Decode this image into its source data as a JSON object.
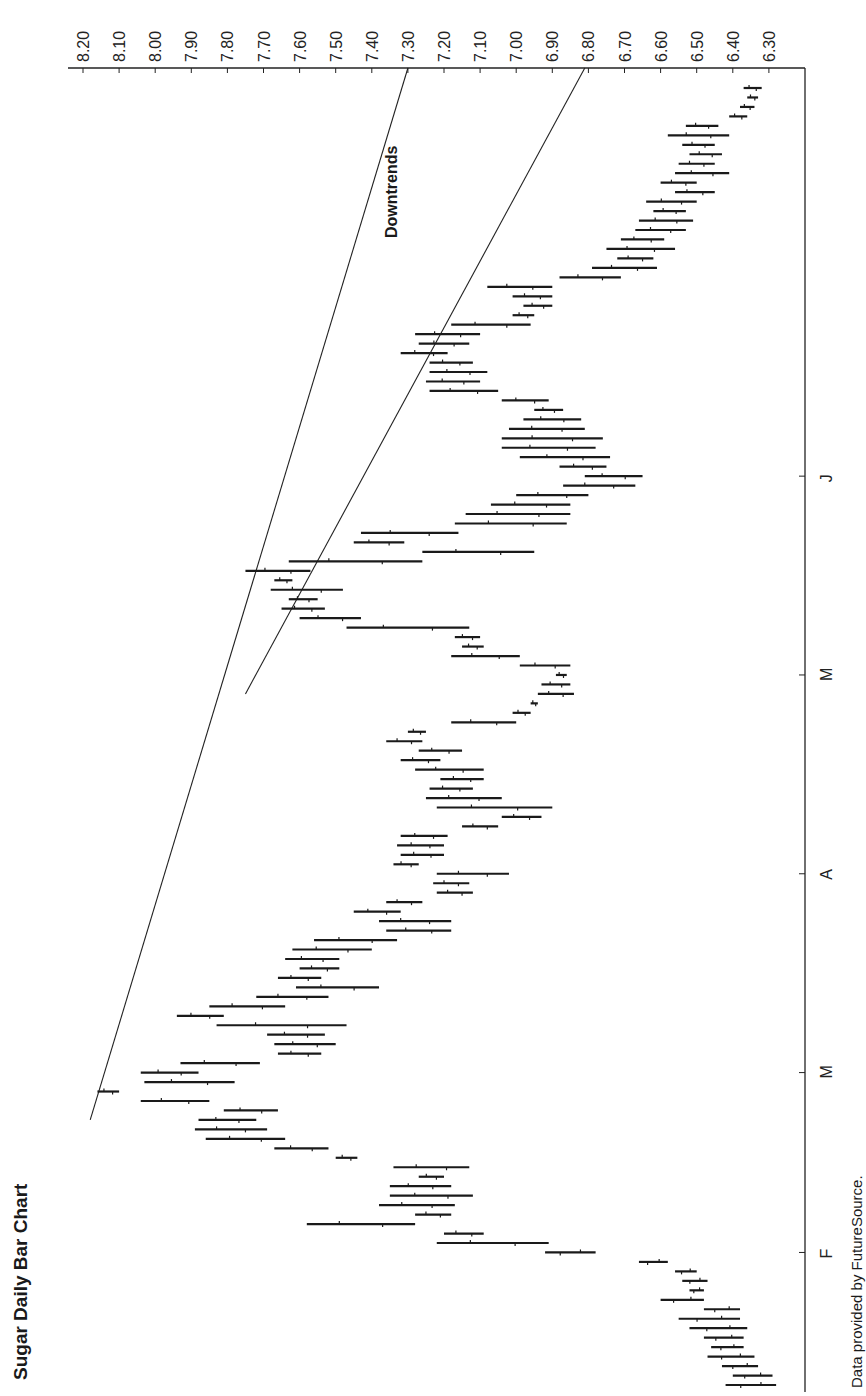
{
  "title": "Sugar Daily Bar Chart",
  "source": "Data provided by FutureSource.",
  "annotation": "Downtrends",
  "chart_data": {
    "type": "bar",
    "subtype": "ohlc-daily",
    "orientation": "rotated-90-ccw",
    "title": "Sugar Daily Bar Chart",
    "xlabel": "",
    "ylabel": "",
    "price_ticks": [
      "8.20",
      "8.10",
      "8.00",
      "7.90",
      "7.80",
      "7.70",
      "7.60",
      "7.50",
      "7.40",
      "7.30",
      "7.20",
      "7.10",
      "7.00",
      "6.90",
      "6.80",
      "6.70",
      "6.60",
      "6.50",
      "6.40",
      "6.30"
    ],
    "price_range": [
      6.25,
      8.22
    ],
    "month_ticks": [
      {
        "label": "F",
        "day": 14
      },
      {
        "label": "M",
        "day": 33
      },
      {
        "label": "A",
        "day": 54
      },
      {
        "label": "M",
        "day": 75
      },
      {
        "label": "J",
        "day": 96
      }
    ],
    "annotations": [
      "Downtrends"
    ],
    "trendlines": [
      {
        "name": "downtrend-1",
        "from": {
          "day": 28,
          "price": 8.18
        },
        "to": {
          "day": 117,
          "price": 7.3
        }
      },
      {
        "name": "downtrend-2",
        "from": {
          "day": 73,
          "price": 7.75
        },
        "to": {
          "day": 117,
          "price": 6.81
        }
      }
    ],
    "bars": [
      {
        "day": 0,
        "high": 6.28,
        "low": 6.42
      },
      {
        "day": 1,
        "high": 6.29,
        "low": 6.4
      },
      {
        "day": 2,
        "high": 6.33,
        "low": 6.43
      },
      {
        "day": 3,
        "high": 6.34,
        "low": 6.47
      },
      {
        "day": 4,
        "high": 6.37,
        "low": 6.46
      },
      {
        "day": 5,
        "high": 6.37,
        "low": 6.48
      },
      {
        "day": 6,
        "high": 6.36,
        "low": 6.52
      },
      {
        "day": 7,
        "high": 6.38,
        "low": 6.55
      },
      {
        "day": 8,
        "high": 6.38,
        "low": 6.48
      },
      {
        "day": 9,
        "high": 6.48,
        "low": 6.6
      },
      {
        "day": 10,
        "high": 6.48,
        "low": 6.52
      },
      {
        "day": 11,
        "high": 6.47,
        "low": 6.54
      },
      {
        "day": 12,
        "high": 6.5,
        "low": 6.56
      },
      {
        "day": 13,
        "high": 6.58,
        "low": 6.66
      },
      {
        "day": 14,
        "high": 6.78,
        "low": 6.92
      },
      {
        "day": 15,
        "high": 7.22,
        "low": 6.91
      },
      {
        "day": 16,
        "high": 7.2,
        "low": 7.09
      },
      {
        "day": 17,
        "high": 7.58,
        "low": 7.28
      },
      {
        "day": 18,
        "high": 7.28,
        "low": 7.18
      },
      {
        "day": 19,
        "high": 7.38,
        "low": 7.17
      },
      {
        "day": 20,
        "high": 7.35,
        "low": 7.12
      },
      {
        "day": 21,
        "high": 7.35,
        "low": 7.18
      },
      {
        "day": 22,
        "high": 7.27,
        "low": 7.2
      },
      {
        "day": 23,
        "high": 7.34,
        "low": 7.13
      },
      {
        "day": 24,
        "high": 7.5,
        "low": 7.44
      },
      {
        "day": 25,
        "high": 7.67,
        "low": 7.52
      },
      {
        "day": 26,
        "high": 7.86,
        "low": 7.64
      },
      {
        "day": 27,
        "high": 7.89,
        "low": 7.69
      },
      {
        "day": 28,
        "high": 7.88,
        "low": 7.72
      },
      {
        "day": 29,
        "high": 7.81,
        "low": 7.66
      },
      {
        "day": 30,
        "high": 8.04,
        "low": 7.85
      },
      {
        "day": 31,
        "high": 8.16,
        "low": 8.1
      },
      {
        "day": 32,
        "high": 8.03,
        "low": 7.78
      },
      {
        "day": 33,
        "high": 8.04,
        "low": 7.88
      },
      {
        "day": 34,
        "high": 7.93,
        "low": 7.71
      },
      {
        "day": 35,
        "high": 7.66,
        "low": 7.54
      },
      {
        "day": 36,
        "high": 7.67,
        "low": 7.5
      },
      {
        "day": 37,
        "high": 7.69,
        "low": 7.53
      },
      {
        "day": 38,
        "high": 7.83,
        "low": 7.47
      },
      {
        "day": 39,
        "high": 7.94,
        "low": 7.81
      },
      {
        "day": 40,
        "high": 7.85,
        "low": 7.64
      },
      {
        "day": 41,
        "high": 7.72,
        "low": 7.52
      },
      {
        "day": 42,
        "high": 7.61,
        "low": 7.38
      },
      {
        "day": 43,
        "high": 7.66,
        "low": 7.54
      },
      {
        "day": 44,
        "high": 7.6,
        "low": 7.49
      },
      {
        "day": 45,
        "high": 7.64,
        "low": 7.49
      },
      {
        "day": 46,
        "high": 7.62,
        "low": 7.4
      },
      {
        "day": 47,
        "high": 7.56,
        "low": 7.33
      },
      {
        "day": 48,
        "high": 7.36,
        "low": 7.18
      },
      {
        "day": 49,
        "high": 7.38,
        "low": 7.18
      },
      {
        "day": 50,
        "high": 7.45,
        "low": 7.32
      },
      {
        "day": 51,
        "high": 7.36,
        "low": 7.26
      },
      {
        "day": 52,
        "high": 7.22,
        "low": 7.12
      },
      {
        "day": 53,
        "high": 7.23,
        "low": 7.13
      },
      {
        "day": 54,
        "high": 7.22,
        "low": 7.02
      },
      {
        "day": 55,
        "high": 7.34,
        "low": 7.27
      },
      {
        "day": 56,
        "high": 7.32,
        "low": 7.2
      },
      {
        "day": 57,
        "high": 7.33,
        "low": 7.2
      },
      {
        "day": 58,
        "high": 7.32,
        "low": 7.19
      },
      {
        "day": 59,
        "high": 7.15,
        "low": 7.05
      },
      {
        "day": 60,
        "high": 7.04,
        "low": 6.93
      },
      {
        "day": 61,
        "high": 7.22,
        "low": 6.9
      },
      {
        "day": 62,
        "high": 7.25,
        "low": 7.04
      },
      {
        "day": 63,
        "high": 7.24,
        "low": 7.12
      },
      {
        "day": 64,
        "high": 7.21,
        "low": 7.09
      },
      {
        "day": 65,
        "high": 7.28,
        "low": 7.09
      },
      {
        "day": 66,
        "high": 7.32,
        "low": 7.21
      },
      {
        "day": 67,
        "high": 7.27,
        "low": 7.15
      },
      {
        "day": 68,
        "high": 7.36,
        "low": 7.26
      },
      {
        "day": 69,
        "high": 7.3,
        "low": 7.25
      },
      {
        "day": 70,
        "high": 7.18,
        "low": 7.0
      },
      {
        "day": 71,
        "high": 7.01,
        "low": 6.96
      },
      {
        "day": 72,
        "high": 6.96,
        "low": 6.94
      },
      {
        "day": 73,
        "high": 6.94,
        "low": 6.84
      },
      {
        "day": 74,
        "high": 6.93,
        "low": 6.85
      },
      {
        "day": 75,
        "high": 6.89,
        "low": 6.86
      },
      {
        "day": 76,
        "high": 6.99,
        "low": 6.85
      },
      {
        "day": 77,
        "high": 7.18,
        "low": 6.99
      },
      {
        "day": 78,
        "high": 7.15,
        "low": 7.09
      },
      {
        "day": 79,
        "high": 7.17,
        "low": 7.1
      },
      {
        "day": 80,
        "high": 7.47,
        "low": 7.13
      },
      {
        "day": 81,
        "high": 7.6,
        "low": 7.43
      },
      {
        "day": 82,
        "high": 7.65,
        "low": 7.53
      },
      {
        "day": 83,
        "high": 7.63,
        "low": 7.55
      },
      {
        "day": 84,
        "high": 7.68,
        "low": 7.48
      },
      {
        "day": 85,
        "high": 7.67,
        "low": 7.62
      },
      {
        "day": 86,
        "high": 7.75,
        "low": 7.57
      },
      {
        "day": 87,
        "high": 7.63,
        "low": 7.26
      },
      {
        "day": 88,
        "high": 7.26,
        "low": 6.95
      },
      {
        "day": 89,
        "high": 7.45,
        "low": 7.31
      },
      {
        "day": 90,
        "high": 7.43,
        "low": 7.16
      },
      {
        "day": 91,
        "high": 7.17,
        "low": 6.86
      },
      {
        "day": 92,
        "high": 7.14,
        "low": 6.85
      },
      {
        "day": 93,
        "high": 7.07,
        "low": 6.85
      },
      {
        "day": 94,
        "high": 7.0,
        "low": 6.8
      },
      {
        "day": 95,
        "high": 6.87,
        "low": 6.67
      },
      {
        "day": 96,
        "high": 6.81,
        "low": 6.65
      },
      {
        "day": 97,
        "high": 6.88,
        "low": 6.75
      },
      {
        "day": 98,
        "high": 6.99,
        "low": 6.74
      },
      {
        "day": 99,
        "high": 7.04,
        "low": 6.78
      },
      {
        "day": 100,
        "high": 7.04,
        "low": 6.76
      },
      {
        "day": 101,
        "high": 7.02,
        "low": 6.81
      },
      {
        "day": 102,
        "high": 6.98,
        "low": 6.82
      },
      {
        "day": 103,
        "high": 6.95,
        "low": 6.87
      },
      {
        "day": 104,
        "high": 7.04,
        "low": 6.91
      },
      {
        "day": 105,
        "high": 7.24,
        "low": 7.05
      },
      {
        "day": 106,
        "high": 7.25,
        "low": 7.1
      },
      {
        "day": 107,
        "high": 7.24,
        "low": 7.08
      },
      {
        "day": 108,
        "high": 7.24,
        "low": 7.12
      },
      {
        "day": 109,
        "high": 7.32,
        "low": 7.19
      },
      {
        "day": 110,
        "high": 7.27,
        "low": 7.13
      },
      {
        "day": 111,
        "high": 7.28,
        "low": 7.1
      },
      {
        "day": 112,
        "high": 7.18,
        "low": 6.96
      },
      {
        "day": 113,
        "high": 7.01,
        "low": 6.95
      },
      {
        "day": 114,
        "high": 6.98,
        "low": 6.9
      },
      {
        "day": 115,
        "high": 7.01,
        "low": 6.9
      },
      {
        "day": 116,
        "high": 7.08,
        "low": 6.9
      },
      {
        "day": 117,
        "high": 6.88,
        "low": 6.71
      },
      {
        "day": 118,
        "high": 6.79,
        "low": 6.61
      },
      {
        "day": 119,
        "high": 6.72,
        "low": 6.62
      },
      {
        "day": 120,
        "high": 6.75,
        "low": 6.56
      },
      {
        "day": 121,
        "high": 6.71,
        "low": 6.59
      },
      {
        "day": 122,
        "high": 6.67,
        "low": 6.53
      },
      {
        "day": 123,
        "high": 6.66,
        "low": 6.51
      },
      {
        "day": 124,
        "high": 6.62,
        "low": 6.53
      },
      {
        "day": 125,
        "high": 6.64,
        "low": 6.5
      },
      {
        "day": 126,
        "high": 6.56,
        "low": 6.45
      },
      {
        "day": 127,
        "high": 6.6,
        "low": 6.5
      },
      {
        "day": 128,
        "high": 6.56,
        "low": 6.41
      },
      {
        "day": 129,
        "high": 6.55,
        "low": 6.45
      },
      {
        "day": 130,
        "high": 6.52,
        "low": 6.43
      },
      {
        "day": 131,
        "high": 6.54,
        "low": 6.45
      },
      {
        "day": 132,
        "high": 6.58,
        "low": 6.41
      },
      {
        "day": 133,
        "high": 6.53,
        "low": 6.44
      },
      {
        "day": 134,
        "high": 6.41,
        "low": 6.36
      },
      {
        "day": 135,
        "high": 6.38,
        "low": 6.34
      },
      {
        "day": 136,
        "high": 6.36,
        "low": 6.33
      },
      {
        "day": 137,
        "high": 6.37,
        "low": 6.32
      }
    ]
  }
}
